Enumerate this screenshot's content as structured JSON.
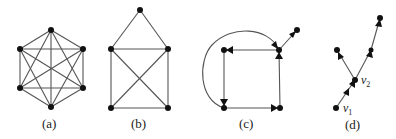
{
  "figure": {
    "panels": [
      {
        "id": "a",
        "caption": "(a)",
        "description": "Complete graph K6 drawn as a hexagon with all diagonals",
        "vertices": [
          [
            51,
            30
          ],
          [
            20,
            49
          ],
          [
            83,
            49
          ],
          [
            20,
            88
          ],
          [
            83,
            88
          ],
          [
            51,
            107
          ]
        ],
        "directed": false
      },
      {
        "id": "b",
        "caption": "(b)",
        "description": "House-shaped graph: triangle roof on a square with both diagonals",
        "vertices": [
          [
            140,
            10
          ],
          [
            111,
            49
          ],
          [
            168,
            49
          ],
          [
            111,
            108
          ],
          [
            168,
            108
          ]
        ],
        "directed": false
      },
      {
        "id": "c",
        "caption": "(c)",
        "description": "Directed graph: square cycle with a curved arc and a pendant arc",
        "vertices": [
          [
            224,
            50
          ],
          [
            279,
            50
          ],
          [
            224,
            108
          ],
          [
            280,
            108
          ],
          [
            297,
            30
          ]
        ],
        "directed": true
      },
      {
        "id": "d",
        "caption": "(d)",
        "description": "Directed tree rooted at v1 branching at v2",
        "vertices": [
          [
            336,
            108
          ],
          [
            355,
            80
          ],
          [
            337,
            50
          ],
          [
            380,
            18
          ]
        ],
        "vertex_labels": {
          "v1": {
            "base": "v",
            "sub": "1"
          },
          "v2": {
            "base": "v",
            "sub": "2"
          }
        },
        "directed": true
      }
    ]
  }
}
